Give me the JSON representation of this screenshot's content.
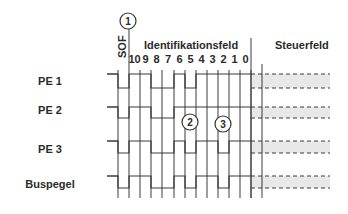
{
  "header": {
    "sof_label": "SOF",
    "id_field_label": "Identifikationsfeld",
    "control_field_label": "Steuerfeld",
    "bit_labels": [
      "10",
      "9",
      "8",
      "7",
      "6",
      "5",
      "4",
      "3",
      "2",
      "1",
      "0"
    ]
  },
  "markers": [
    {
      "number": "1",
      "meaning": "SOF"
    },
    {
      "number": "2",
      "meaning": "PE 2 loses arbitration at bit 5"
    },
    {
      "number": "3",
      "meaning": "PE 1 loses arbitration at bit 2"
    }
  ],
  "rows": [
    {
      "label": "PE 1",
      "bits": [
        0,
        1,
        1,
        0,
        0,
        1,
        0,
        1,
        1,
        1,
        1,
        1
      ]
    },
    {
      "label": "PE 2",
      "bits": [
        0,
        1,
        1,
        0,
        0,
        1,
        1,
        1,
        1,
        1,
        1,
        1
      ]
    },
    {
      "label": "PE 3",
      "bits": [
        0,
        1,
        1,
        0,
        0,
        1,
        0,
        1,
        1,
        0,
        1,
        1
      ]
    },
    {
      "label": "Buspegel",
      "bits": [
        0,
        1,
        1,
        0,
        0,
        1,
        0,
        1,
        1,
        0,
        1,
        1
      ]
    }
  ],
  "colors": {
    "line": "#3a3a3a",
    "shade": "#e8e8e8",
    "text": "#2a2a2a"
  }
}
